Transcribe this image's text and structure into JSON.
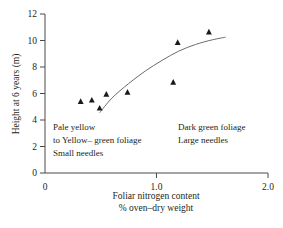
{
  "chart_data": {
    "type": "scatter",
    "title": "",
    "xlabel": "Foliar nitrogen content",
    "xlabel_line2": "% oven–dry weight",
    "ylabel": "Height at 6 years (m)",
    "xlim": [
      0,
      2.0
    ],
    "ylim": [
      0,
      12
    ],
    "xticks": [
      0,
      1.0,
      2.0
    ],
    "xtick_labels": [
      "0",
      "1.0",
      "2.0"
    ],
    "yticks": [
      0,
      2,
      4,
      6,
      8,
      10,
      12
    ],
    "ytick_labels": [
      "0",
      "2",
      "4",
      "6",
      "8",
      "10",
      "12"
    ],
    "grid": false,
    "legend": false,
    "marker_shape": "triangle",
    "marker_color": "#1a1a1a",
    "curve_color": "#6b6b6b",
    "points": [
      {
        "x": 0.32,
        "y": 5.4
      },
      {
        "x": 0.42,
        "y": 5.5
      },
      {
        "x": 0.49,
        "y": 4.9
      },
      {
        "x": 0.55,
        "y": 5.95
      },
      {
        "x": 0.74,
        "y": 6.1
      },
      {
        "x": 1.15,
        "y": 6.85
      },
      {
        "x": 1.19,
        "y": 9.85
      },
      {
        "x": 1.47,
        "y": 10.65
      }
    ],
    "fit_curve": [
      {
        "x": 0.49,
        "y": 4.55
      },
      {
        "x": 0.6,
        "y": 5.65
      },
      {
        "x": 0.75,
        "y": 6.75
      },
      {
        "x": 0.9,
        "y": 7.7
      },
      {
        "x": 1.05,
        "y": 8.5
      },
      {
        "x": 1.2,
        "y": 9.2
      },
      {
        "x": 1.35,
        "y": 9.7
      },
      {
        "x": 1.5,
        "y": 10.05
      },
      {
        "x": 1.62,
        "y": 10.25
      }
    ],
    "annotations": [
      {
        "name": "left",
        "lines": [
          "Pale yellow",
          "to Yellow– green foliage",
          "Small needles"
        ]
      },
      {
        "name": "right",
        "lines": [
          "Dark green foliage",
          "Large needles"
        ]
      }
    ]
  }
}
